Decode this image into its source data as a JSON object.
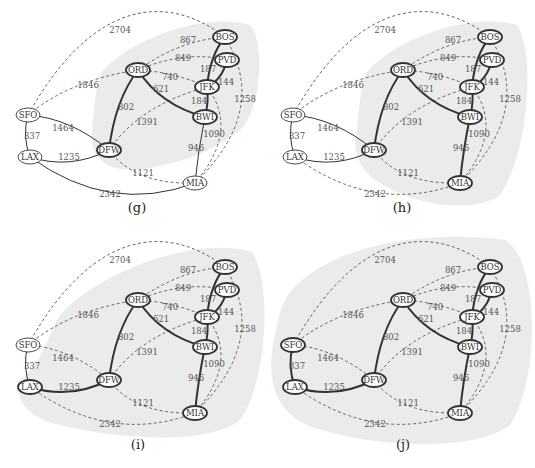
{
  "figure": {
    "nodes": [
      {
        "id": "SFO",
        "x": 28,
        "y": 115
      },
      {
        "id": "LAX",
        "x": 30,
        "y": 157
      },
      {
        "id": "DFW",
        "x": 109,
        "y": 150
      },
      {
        "id": "ORD",
        "x": 138,
        "y": 70
      },
      {
        "id": "BOS",
        "x": 225,
        "y": 37
      },
      {
        "id": "PVD",
        "x": 227,
        "y": 60
      },
      {
        "id": "JFK",
        "x": 207,
        "y": 87
      },
      {
        "id": "BWI",
        "x": 205,
        "y": 117
      },
      {
        "id": "MIA",
        "x": 195,
        "y": 183
      }
    ],
    "edges": [
      {
        "id": "SFO-BOS",
        "a": "SFO",
        "b": "BOS",
        "w": "2704",
        "lx": 120,
        "ly": 33
      },
      {
        "id": "SFO-ORD",
        "a": "SFO",
        "b": "ORD",
        "w": "1846",
        "lx": 88,
        "ly": 88
      },
      {
        "id": "SFO-LAX",
        "a": "SFO",
        "b": "LAX",
        "w": "337",
        "lx": 32,
        "ly": 139
      },
      {
        "id": "SFO-DFW",
        "a": "SFO",
        "b": "DFW",
        "w": "1464",
        "lx": 63,
        "ly": 131
      },
      {
        "id": "LAX-DFW",
        "a": "LAX",
        "b": "DFW",
        "w": "1235",
        "lx": 69,
        "ly": 160
      },
      {
        "id": "LAX-MIA",
        "a": "LAX",
        "b": "MIA",
        "w": "2342",
        "lx": 110,
        "ly": 197
      },
      {
        "id": "DFW-ORD",
        "a": "DFW",
        "b": "ORD",
        "w": "802",
        "lx": 126,
        "ly": 110
      },
      {
        "id": "DFW-JFK",
        "a": "DFW",
        "b": "JFK",
        "w": "1391",
        "lx": 147,
        "ly": 125
      },
      {
        "id": "DFW-MIA",
        "a": "DFW",
        "b": "MIA",
        "w": "1121",
        "lx": 143,
        "ly": 176
      },
      {
        "id": "ORD-BOS",
        "a": "ORD",
        "b": "BOS",
        "w": "867",
        "lx": 188,
        "ly": 43
      },
      {
        "id": "ORD-PVD",
        "a": "ORD",
        "b": "PVD",
        "w": "849",
        "lx": 183,
        "ly": 61
      },
      {
        "id": "ORD-JFK",
        "a": "ORD",
        "b": "JFK",
        "w": "740",
        "lx": 170,
        "ly": 80
      },
      {
        "id": "ORD-BWI",
        "a": "ORD",
        "b": "BWI",
        "w": "621",
        "lx": 161,
        "ly": 92
      },
      {
        "id": "BOS-JFK",
        "a": "BOS",
        "b": "JFK",
        "w": "187",
        "lx": 208,
        "ly": 72
      },
      {
        "id": "PVD-JFK",
        "a": "PVD",
        "b": "JFK",
        "w": "144",
        "lx": 226,
        "ly": 85
      },
      {
        "id": "JFK-BWI",
        "a": "JFK",
        "b": "BWI",
        "w": "184",
        "lx": 199,
        "ly": 104
      },
      {
        "id": "BOS-MIA",
        "a": "BOS",
        "b": "MIA",
        "w": "1258",
        "lx": 245,
        "ly": 102
      },
      {
        "id": "JFK-MIA",
        "a": "JFK",
        "b": "MIA",
        "w": "1090",
        "lx": 214,
        "ly": 137
      },
      {
        "id": "BWI-MIA",
        "a": "BWI",
        "b": "MIA",
        "w": "946",
        "lx": 196,
        "ly": 151
      }
    ]
  },
  "panels": [
    {
      "id": "g",
      "caption": "(g)",
      "origin": [
        0,
        0
      ],
      "shaded_nodes": [
        "ORD",
        "DFW",
        "BOS",
        "PVD",
        "JFK",
        "BWI"
      ],
      "thick_edges": [
        "BOS-JFK",
        "PVD-JFK",
        "JFK-BWI",
        "ORD-BWI",
        "DFW-ORD"
      ],
      "thin_edges": [
        "SFO-LAX",
        "SFO-DFW",
        "LAX-DFW",
        "BWI-MIA",
        "LAX-MIA"
      ],
      "thick_nodes": [
        "ORD",
        "DFW",
        "BOS",
        "PVD",
        "JFK",
        "BWI"
      ]
    },
    {
      "id": "h",
      "caption": "(h)",
      "origin": [
        265,
        0
      ],
      "shaded_nodes": [
        "ORD",
        "DFW",
        "BOS",
        "PVD",
        "JFK",
        "BWI",
        "MIA"
      ],
      "thick_edges": [
        "BOS-JFK",
        "PVD-JFK",
        "JFK-BWI",
        "ORD-BWI",
        "DFW-ORD",
        "BWI-MIA"
      ],
      "thin_edges": [
        "SFO-LAX",
        "SFO-DFW",
        "LAX-DFW"
      ],
      "thick_nodes": [
        "ORD",
        "DFW",
        "BOS",
        "PVD",
        "JFK",
        "BWI",
        "MIA"
      ]
    },
    {
      "id": "i",
      "caption": "(i)",
      "origin": [
        0,
        230
      ],
      "shaded_nodes": [
        "ORD",
        "DFW",
        "BOS",
        "PVD",
        "JFK",
        "BWI",
        "MIA",
        "LAX"
      ],
      "thick_edges": [
        "BOS-JFK",
        "PVD-JFK",
        "JFK-BWI",
        "ORD-BWI",
        "DFW-ORD",
        "BWI-MIA",
        "LAX-DFW"
      ],
      "thin_edges": [
        "SFO-LAX"
      ],
      "thick_nodes": [
        "ORD",
        "DFW",
        "BOS",
        "PVD",
        "JFK",
        "BWI",
        "MIA",
        "LAX"
      ]
    },
    {
      "id": "j",
      "caption": "(j)",
      "origin": [
        265,
        230
      ],
      "shaded_nodes": [
        "ORD",
        "DFW",
        "BOS",
        "PVD",
        "JFK",
        "BWI",
        "MIA",
        "LAX",
        "SFO"
      ],
      "thick_edges": [
        "BOS-JFK",
        "PVD-JFK",
        "JFK-BWI",
        "ORD-BWI",
        "DFW-ORD",
        "BWI-MIA",
        "LAX-DFW",
        "SFO-LAX"
      ],
      "thin_edges": [],
      "thick_nodes": [
        "ORD",
        "DFW",
        "BOS",
        "PVD",
        "JFK",
        "BWI",
        "MIA",
        "LAX",
        "SFO"
      ]
    }
  ],
  "colors": {
    "shade": "#ebebeb",
    "edge": "#333333",
    "dashed_edge": "#555555",
    "node_fill": "#ffffff"
  }
}
